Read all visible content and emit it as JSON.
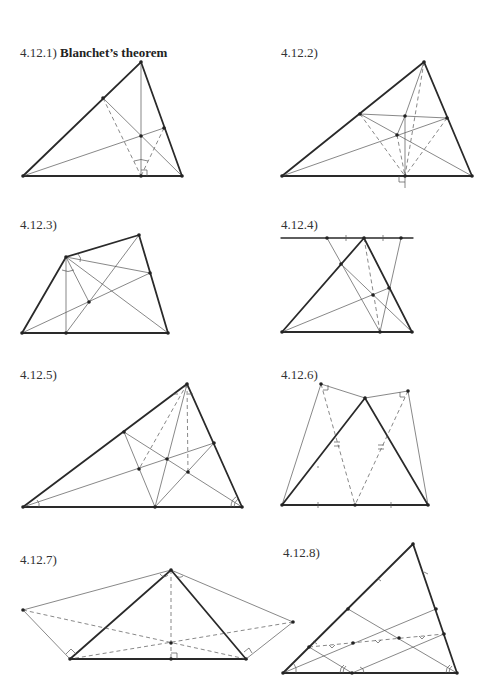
{
  "page": {
    "section": "4.12",
    "figures": [
      {
        "id": "4.12.1",
        "label": "4.12.1)",
        "title": "Blanchet’s theorem"
      },
      {
        "id": "4.12.2",
        "label": "4.12.2)",
        "title": ""
      },
      {
        "id": "4.12.3",
        "label": "4.12.3)",
        "title": ""
      },
      {
        "id": "4.12.4",
        "label": "4.12.4)",
        "title": ""
      },
      {
        "id": "4.12.5",
        "label": "4.12.5)",
        "title": ""
      },
      {
        "id": "4.12.6",
        "label": "4.12.6)",
        "title": ""
      },
      {
        "id": "4.12.7",
        "label": "4.12.7)",
        "title": ""
      },
      {
        "id": "4.12.8",
        "label": "4.12.8)",
        "title": ""
      }
    ]
  },
  "colors": {
    "ink": "#2a2a2a",
    "thin_line": "#555555",
    "background": "#ffffff"
  }
}
